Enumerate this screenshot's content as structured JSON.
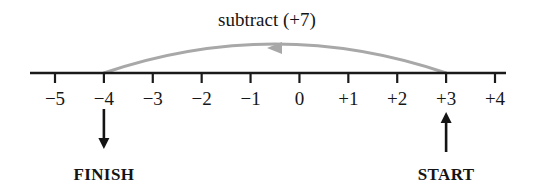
{
  "chart_data": {
    "type": "numberline",
    "title": "subtract (+7)",
    "axis": {
      "min": -5,
      "max": 4,
      "tick_step": 1,
      "tick_labels": [
        "−5",
        "−4",
        "−3",
        "−2",
        "−1",
        "0",
        "+1",
        "+2",
        "+3",
        "+4"
      ],
      "tick_values": [
        -5,
        -4,
        -3,
        -2,
        -1,
        0,
        1,
        2,
        3,
        4
      ]
    },
    "operation": {
      "label": "subtract (+7)",
      "start_value": 3,
      "finish_value": -4,
      "magnitude": 7,
      "direction": "left",
      "arc_color": "#a8a8a8"
    },
    "markers": [
      {
        "name": "start",
        "label": "START",
        "value": 3,
        "arrow_direction": "up",
        "color": "#141414"
      },
      {
        "name": "finish",
        "label": "FINISH",
        "value": -4,
        "arrow_direction": "down",
        "color": "#141414"
      }
    ],
    "colors": {
      "axis": "#1a1a1a",
      "text": "#141414",
      "arc": "#a8a8a8",
      "background": "#ffffff"
    }
  }
}
